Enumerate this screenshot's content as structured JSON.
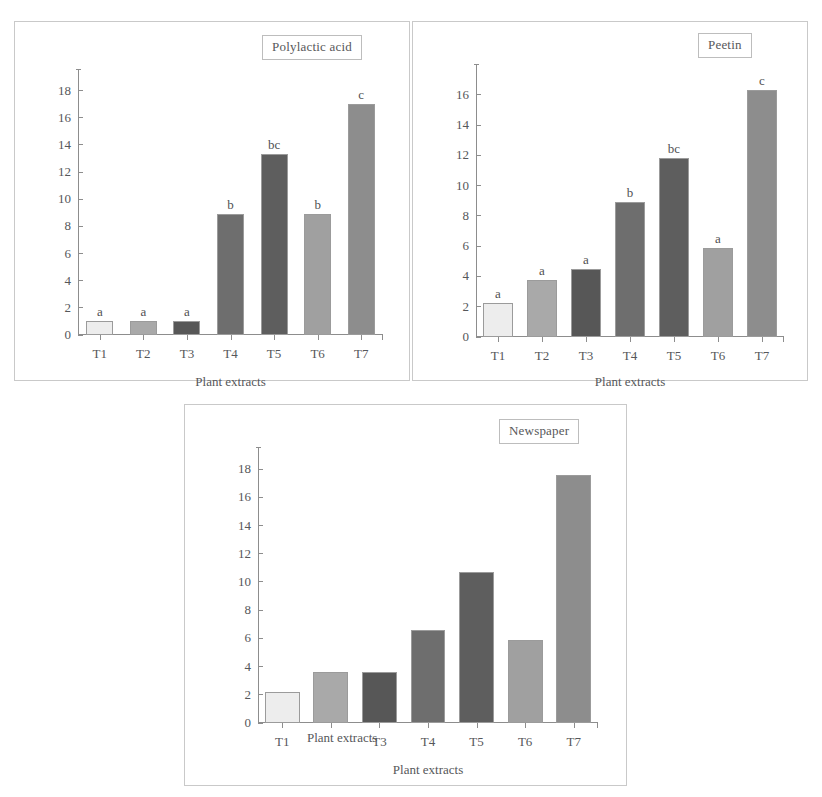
{
  "figure": {
    "shared_xlabel": "Plant extracts",
    "categories": [
      "T1",
      "T2",
      "T3",
      "T4",
      "T5",
      "T6",
      "T7"
    ],
    "bar_colors": [
      "#ededed",
      "#a9a9a9",
      "#575757",
      "#6e6e6e",
      "#5e5e5e",
      "#a0a0a0",
      "#8d8d8d"
    ],
    "bar_border": "#9b9b9b",
    "axis_color": "#8d8d8d",
    "frame_color": "#c9c9c9",
    "text_color": "#56575a"
  },
  "panels": [
    {
      "id": "polylactic",
      "title": "Polylactic acid",
      "xlabel": "Plant extracts",
      "yticks": [
        "0",
        "2",
        "4",
        "6",
        "8",
        "10",
        "12",
        "14",
        "16",
        "18"
      ],
      "letters": [
        "a",
        "a",
        "a",
        "b",
        "bc",
        "b",
        "c"
      ],
      "stray_label": null
    },
    {
      "id": "peetin",
      "title": "Peetin",
      "xlabel": "Plant extracts",
      "yticks": [
        "0",
        "2",
        "4",
        "6",
        "8",
        "10",
        "12",
        "14",
        "16"
      ],
      "letters": [
        "a",
        "a",
        "a",
        "b",
        "bc",
        "a",
        "c"
      ],
      "stray_label": null
    },
    {
      "id": "newspaper",
      "title": "Newspaper",
      "xlabel": "Plant extracts",
      "yticks": [
        "0",
        "2",
        "4",
        "6",
        "8",
        "10",
        "12",
        "14",
        "16",
        "18"
      ],
      "letters": [
        "",
        "",
        "",
        "",
        "",
        "",
        ""
      ],
      "stray_label": "Plant extracts"
    }
  ],
  "chart_data": [
    {
      "type": "bar",
      "title": "Polylactic acid",
      "xlabel": "Plant extracts",
      "ylabel": "",
      "categories": [
        "T1",
        "T2",
        "T3",
        "T4",
        "T5",
        "T6",
        "T7"
      ],
      "values": [
        1.0,
        1.05,
        1.05,
        8.9,
        13.3,
        8.9,
        17.0
      ],
      "annotations": [
        "a",
        "a",
        "a",
        "b",
        "bc",
        "b",
        "c"
      ],
      "ylim": [
        0,
        19
      ],
      "yticks": [
        0,
        2,
        4,
        6,
        8,
        10,
        12,
        14,
        16,
        18
      ],
      "grid": false,
      "legend": "none"
    },
    {
      "type": "bar",
      "title": "Peetin",
      "xlabel": "Plant extracts",
      "ylabel": "",
      "categories": [
        "T1",
        "T2",
        "T3",
        "T4",
        "T5",
        "T6",
        "T7"
      ],
      "values": [
        2.25,
        3.75,
        4.5,
        8.9,
        11.8,
        5.9,
        16.3
      ],
      "annotations": [
        "a",
        "a",
        "a",
        "b",
        "bc",
        "a",
        "c"
      ],
      "ylim": [
        0,
        17.5
      ],
      "yticks": [
        0,
        2,
        4,
        6,
        8,
        10,
        12,
        14,
        16
      ],
      "grid": false,
      "legend": "none"
    },
    {
      "type": "bar",
      "title": "Newspaper",
      "xlabel": "Plant extracts",
      "ylabel": "",
      "categories": [
        "T1",
        "T2",
        "T3",
        "T4",
        "T5",
        "T6",
        "T7"
      ],
      "values": [
        2.2,
        3.65,
        3.6,
        6.6,
        10.7,
        5.85,
        17.6
      ],
      "annotations": [
        "",
        "",
        "",
        "",
        "",
        "",
        ""
      ],
      "ylim": [
        0,
        19
      ],
      "yticks": [
        0,
        2,
        4,
        6,
        8,
        10,
        12,
        14,
        16,
        18
      ],
      "grid": false,
      "legend": "none"
    }
  ]
}
